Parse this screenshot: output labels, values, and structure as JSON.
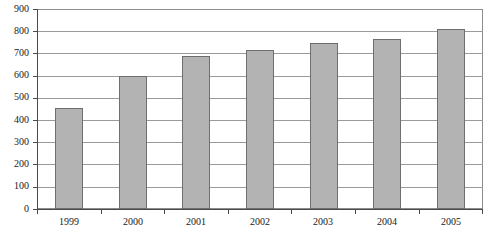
{
  "chart_data": {
    "type": "bar",
    "title": "",
    "subtitle": "",
    "xlabel": "",
    "ylabel": "",
    "categories": [
      "1999",
      "2000",
      "2001",
      "2002",
      "2003",
      "2004",
      "2005"
    ],
    "values": [
      455,
      600,
      688,
      715,
      748,
      765,
      810
    ],
    "series": [
      {
        "name": "",
        "values": [
          455,
          600,
          688,
          715,
          748,
          765,
          810
        ]
      }
    ],
    "ylim": [
      0,
      900
    ],
    "y_ticks": [
      900,
      800,
      700,
      600,
      500,
      400,
      300,
      200,
      100,
      0
    ],
    "y_tick_labels": [
      "900",
      "800",
      "700",
      "600",
      "500",
      "400",
      "300",
      "200",
      "100",
      "0"
    ],
    "grid": true,
    "grid_axis": "y",
    "legend": false,
    "legend_position": "none",
    "annotations": [],
    "colors": {
      "bar_fill": "#b3b3b3",
      "bar_stroke": "#6e6e6e",
      "gridline": "#9a9a9a",
      "axis": "#4a4a4a",
      "frame": "#8c8c8c",
      "text": "#1a1a1a",
      "background": "#ffffff"
    }
  },
  "axes": {
    "y": {
      "ticks": [
        {
          "label": "900"
        },
        {
          "label": "800"
        },
        {
          "label": "700"
        },
        {
          "label": "600"
        },
        {
          "label": "500"
        },
        {
          "label": "400"
        },
        {
          "label": "300"
        },
        {
          "label": "200"
        },
        {
          "label": "100"
        },
        {
          "label": "0"
        }
      ]
    },
    "x": {
      "ticks": [
        {
          "label": "1999"
        },
        {
          "label": "2000"
        },
        {
          "label": "2001"
        },
        {
          "label": "2002"
        },
        {
          "label": "2003"
        },
        {
          "label": "2004"
        },
        {
          "label": "2005"
        }
      ]
    }
  }
}
